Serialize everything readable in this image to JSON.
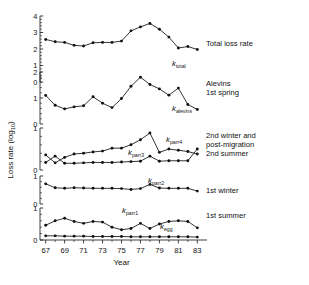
{
  "axes": {
    "xlabel": "Year",
    "ylabel": "Loss rate (log",
    "ylabel_sub": "10",
    "ylabel_tail": ")",
    "xticks": [
      "67",
      "69",
      "71",
      "73",
      "75",
      "77",
      "79",
      "81",
      "83"
    ]
  },
  "legend": {
    "total": "Total loss rate",
    "alevins_1": "Alevins",
    "alevins_2": "1st spring",
    "parr34_1": "2nd winter and",
    "parr34_2": "post-migration",
    "parr34_3": "2nd summer",
    "parr2": "1st winter",
    "parr1": "1st summer"
  },
  "series_labels": {
    "total": "k",
    "total_sub": "total",
    "alevins": "k",
    "alevins_sub": "alevins",
    "parr4": "k",
    "parr4_sub": "parr4",
    "parr3": "k",
    "parr3_sub": "parr3",
    "parr2": "k",
    "parr2_sub": "parr2",
    "parr1": "k",
    "parr1_sub": "parr1",
    "egg": "k",
    "egg_sub": "egg"
  },
  "chart_data": {
    "type": "line",
    "title": "",
    "xlabel": "Year",
    "ylabel": "Loss rate (log10)",
    "grid": false,
    "legend_position": "right",
    "x": [
      67,
      68,
      69,
      70,
      71,
      72,
      73,
      74,
      75,
      76,
      77,
      78,
      79,
      80,
      81,
      82,
      83
    ],
    "xlim": [
      66.4,
      83.6
    ],
    "panels": [
      {
        "name": "panel-total",
        "ylim": [
          0,
          4
        ],
        "yticks": [
          0,
          1,
          2,
          3,
          4
        ],
        "ytick_labels": [
          "0",
          "1",
          "2",
          "3",
          "4"
        ],
        "series": [
          {
            "name": "k_total",
            "label": "k total",
            "legend": "Total loss rate",
            "values": [
              2.58,
              2.44,
              2.4,
              2.22,
              2.18,
              2.38,
              2.4,
              2.4,
              2.48,
              3.1,
              3.34,
              3.55,
              3.2,
              2.72,
              2.06,
              2.15,
              1.97
            ]
          }
        ]
      },
      {
        "name": "panel-alevins",
        "ylim": [
          0,
          2
        ],
        "yticks": [
          0,
          1,
          2
        ],
        "ytick_labels": [
          "0",
          "1",
          "2"
        ],
        "series": [
          {
            "name": "k_alevins",
            "label": "k alevins",
            "legend": "Alevins 1st spring",
            "values": [
              1.1,
              0.72,
              0.58,
              0.66,
              0.7,
              1.05,
              0.8,
              0.63,
              0.98,
              1.45,
              1.8,
              1.52,
              1.35,
              1.11,
              1.38,
              0.75,
              0.56
            ]
          }
        ]
      },
      {
        "name": "panel-parr34",
        "ylim": [
          0,
          1
        ],
        "yticks": [
          0,
          1
        ],
        "ytick_labels": [
          "0",
          "1"
        ],
        "series": [
          {
            "name": "k_parr3",
            "label": "k parr3",
            "legend": "2nd winter and post-migration",
            "values": [
              0.36,
              0.17,
              0.3,
              0.38,
              0.4,
              0.43,
              0.45,
              0.52,
              0.52,
              0.6,
              0.72,
              0.88,
              0.42,
              0.5,
              0.47,
              0.44,
              0.38
            ]
          },
          {
            "name": "k_parr4",
            "label": "k parr4",
            "legend": "2nd summer",
            "values": [
              0.18,
              0.33,
              0.16,
              0.16,
              0.17,
              0.18,
              0.18,
              0.18,
              0.19,
              0.2,
              0.21,
              0.33,
              0.21,
              0.22,
              0.22,
              0.22,
              0.5
            ]
          }
        ]
      },
      {
        "name": "panel-parr2",
        "ylim": [
          0,
          1
        ],
        "yticks": [
          0,
          1
        ],
        "ytick_labels": [
          "0",
          "1"
        ],
        "series": [
          {
            "name": "k_parr2",
            "label": "k parr2",
            "legend": "1st winter",
            "values": [
              0.72,
              0.58,
              0.56,
              0.58,
              0.57,
              0.56,
              0.56,
              0.56,
              0.55,
              0.52,
              0.55,
              0.7,
              0.57,
              0.56,
              0.56,
              0.56,
              0.46
            ]
          }
        ]
      },
      {
        "name": "panel-parr1",
        "ylim": [
          0,
          1
        ],
        "yticks": [
          0,
          1
        ],
        "ytick_labels": [
          "0",
          "1"
        ],
        "series": [
          {
            "name": "k_parr1",
            "label": "k parr1",
            "legend": "1st summer",
            "values": [
              0.46,
              0.6,
              0.68,
              0.58,
              0.52,
              0.58,
              0.56,
              0.4,
              0.32,
              0.36,
              0.52,
              0.36,
              0.5,
              0.58,
              0.6,
              0.58,
              0.38
            ]
          },
          {
            "name": "k_egg",
            "label": "k egg",
            "legend": "",
            "values": [
              0.13,
              0.13,
              0.12,
              0.12,
              0.12,
              0.11,
              0.11,
              0.11,
              0.11,
              0.1,
              0.1,
              0.1,
              0.1,
              0.1,
              0.1,
              0.1,
              0.09
            ]
          }
        ]
      }
    ]
  }
}
